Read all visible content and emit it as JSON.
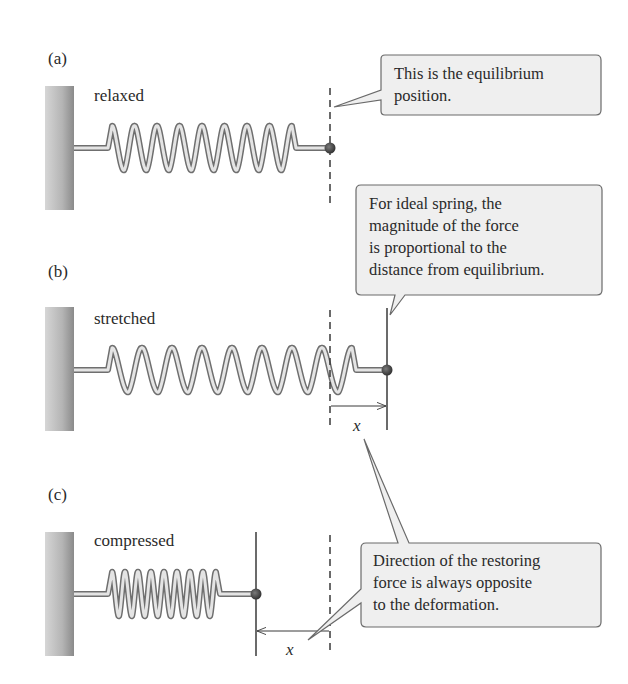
{
  "panels": [
    {
      "id": "a",
      "label": "(a)",
      "state": "relaxed"
    },
    {
      "id": "b",
      "label": "(b)",
      "state": "stretched"
    },
    {
      "id": "c",
      "label": "(c)",
      "state": "compressed"
    }
  ],
  "callouts": [
    {
      "lines": [
        "This is the equilibrium",
        "position."
      ]
    },
    {
      "lines": [
        "For ideal spring, the",
        "magnitude of the force",
        "is proportional to the",
        "distance from equilibrium."
      ]
    },
    {
      "lines": [
        "Direction of the restoring",
        "force is always opposite",
        "to the deformation."
      ]
    }
  ],
  "displacement_labels": {
    "stretched": "x",
    "compressed": "x"
  },
  "colors": {
    "wall": "#9a9a9a",
    "spring_outer": "#6f6f6f",
    "spring_inner": "#e4e4e4",
    "ball": "#4a4a4a",
    "callout_fill": "#efefef",
    "callout_stroke": "#6a6a6a",
    "line": "#3a3a3a"
  }
}
